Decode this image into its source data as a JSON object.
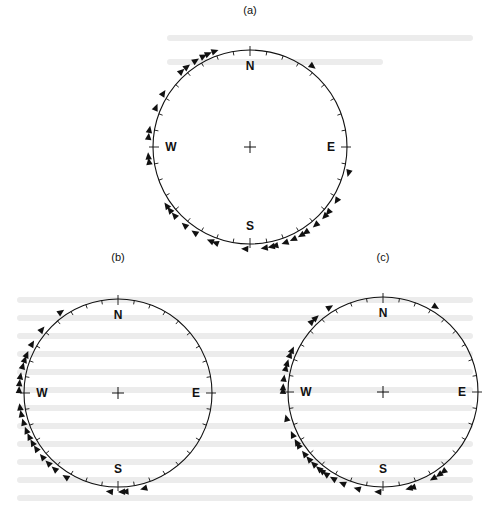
{
  "figure": {
    "panels": [
      {
        "id": "a",
        "label": "(a)",
        "label_pos": [
          250,
          4
        ],
        "center": [
          250,
          147
        ],
        "radius": 97,
        "cardinals": {
          "N": "N",
          "E": "E",
          "S": "S",
          "W": "W"
        },
        "markers_azimuth_deg": [
          38,
          105,
          122,
          130,
          133,
          140,
          147,
          150,
          155,
          160,
          166,
          168,
          172,
          183,
          200,
          203,
          213,
          220,
          228,
          232,
          235,
          262,
          265,
          276,
          280,
          293,
          302,
          318,
          322,
          328,
          333,
          336,
          340
        ]
      },
      {
        "id": "b",
        "label": "(b)",
        "label_pos": [
          118,
          251
        ],
        "center": [
          118,
          393
        ],
        "radius": 94,
        "cardinals": {
          "N": "N",
          "E": "E",
          "S": "S",
          "W": "W"
        },
        "markers_azimuth_deg": [
          165,
          176,
          178,
          185,
          212,
          220,
          225,
          230,
          236,
          240,
          244,
          248,
          253,
          258,
          262,
          272,
          276,
          280,
          286,
          290,
          293,
          300,
          310,
          325
        ]
      },
      {
        "id": "c",
        "label": "(c)",
        "label_pos": [
          383,
          251
        ],
        "center": [
          383,
          392
        ],
        "radius": 95,
        "cardinals": {
          "N": "N",
          "E": "E",
          "S": "S",
          "W": "W"
        },
        "markers_azimuth_deg": [
          32,
          143,
          146,
          150,
          163,
          165,
          183,
          195,
          204,
          210,
          215,
          218,
          220,
          224,
          228,
          232,
          238,
          240,
          245,
          255,
          271,
          273,
          278,
          284,
          287,
          292,
          295,
          315,
          318,
          328
        ]
      }
    ],
    "tick_interval_deg": 10,
    "colors": {
      "ink": "#111111",
      "bleed": "#e6e6e6",
      "background": "#ffffff"
    }
  }
}
